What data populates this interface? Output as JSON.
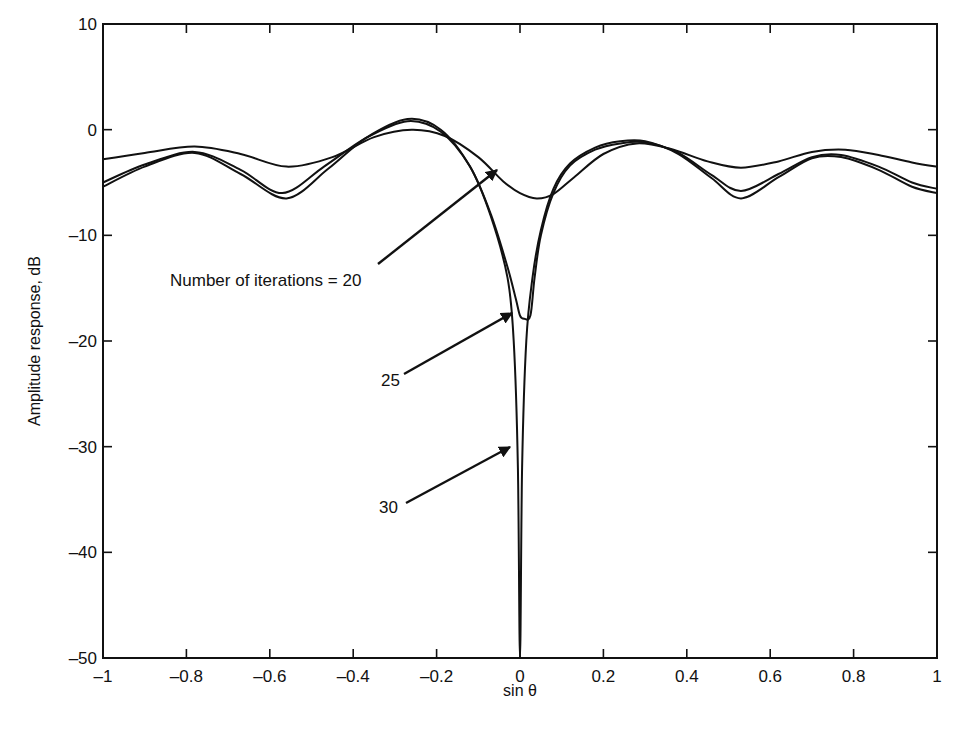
{
  "chart_data": {
    "type": "line",
    "title": "",
    "xlabel": "sin θ",
    "ylabel": "Amplitude response, dB",
    "xlim": [
      -1,
      1
    ],
    "ylim": [
      -50,
      10
    ],
    "grid": false,
    "legend": "none (curves labeled by arrow annotations)",
    "x_ticks": [
      "-1",
      "-0.8",
      "-0.6",
      "-0.4",
      "-0.2",
      "0",
      "0.2",
      "0.4",
      "0.6",
      "0.8",
      "1"
    ],
    "y_ticks": [
      "10",
      "0",
      "-10",
      "-20",
      "-30",
      "-40",
      "-50"
    ],
    "series": [
      {
        "name": "Number of iterations = 20",
        "x": [
          -1.0,
          -0.9,
          -0.78,
          -0.67,
          -0.56,
          -0.45,
          -0.35,
          -0.26,
          -0.18,
          -0.1,
          -0.04,
          0.0,
          0.04,
          0.08,
          0.13,
          0.2,
          0.28,
          0.36,
          0.45,
          0.53,
          0.62,
          0.7,
          0.78,
          0.86,
          0.94,
          1.0
        ],
        "y": [
          -2.8,
          -2.2,
          -1.6,
          -2.3,
          -3.5,
          -2.6,
          -0.7,
          0.0,
          -0.6,
          -2.6,
          -4.9,
          -6.0,
          -6.5,
          -6.1,
          -4.5,
          -2.3,
          -1.3,
          -1.8,
          -3.0,
          -3.6,
          -3.0,
          -2.1,
          -1.9,
          -2.4,
          -3.1,
          -3.5
        ]
      },
      {
        "name": "25",
        "x": [
          -1.0,
          -0.9,
          -0.78,
          -0.67,
          -0.57,
          -0.47,
          -0.37,
          -0.27,
          -0.19,
          -0.12,
          -0.07,
          -0.03,
          -0.01,
          0.0,
          0.01,
          0.025,
          0.035,
          0.05,
          0.08,
          0.12,
          0.18,
          0.24,
          0.3,
          0.38,
          0.46,
          0.53,
          0.62,
          0.7,
          0.77,
          0.86,
          0.94,
          1.0
        ],
        "y": [
          -5.0,
          -3.3,
          -2.1,
          -3.8,
          -6.0,
          -3.5,
          -0.8,
          0.8,
          -0.2,
          -3.5,
          -8.0,
          -13.0,
          -16.0,
          -17.6,
          -17.9,
          -17.6,
          -14.0,
          -10.0,
          -6.0,
          -3.4,
          -1.9,
          -1.3,
          -1.2,
          -2.2,
          -4.3,
          -5.8,
          -4.2,
          -2.6,
          -2.4,
          -3.5,
          -5.0,
          -5.6
        ]
      },
      {
        "name": "30",
        "x": [
          -1.0,
          -0.9,
          -0.78,
          -0.67,
          -0.56,
          -0.46,
          -0.37,
          -0.27,
          -0.19,
          -0.12,
          -0.07,
          -0.03,
          -0.015,
          -0.005,
          0.0,
          0.005,
          0.015,
          0.03,
          0.05,
          0.08,
          0.12,
          0.18,
          0.24,
          0.3,
          0.38,
          0.46,
          0.53,
          0.62,
          0.7,
          0.77,
          0.86,
          0.94,
          1.0
        ],
        "y": [
          -5.4,
          -3.5,
          -2.2,
          -4.2,
          -6.5,
          -3.7,
          -0.8,
          1.0,
          0.0,
          -3.5,
          -8.2,
          -14.0,
          -20.0,
          -32.0,
          -50.0,
          -32.0,
          -20.0,
          -14.0,
          -9.5,
          -5.6,
          -3.2,
          -1.7,
          -1.1,
          -1.1,
          -2.3,
          -4.6,
          -6.5,
          -4.5,
          -2.7,
          -2.6,
          -3.8,
          -5.4,
          -6.0
        ]
      }
    ],
    "annotations": [
      {
        "text": "Number of iterations = 20",
        "points_to": {
          "x": -0.05,
          "y": -3.5
        }
      },
      {
        "text": "25",
        "points_to": {
          "x": -0.01,
          "y": -17
        }
      },
      {
        "text": "30",
        "points_to": {
          "x": -0.005,
          "y": -30
        }
      }
    ]
  },
  "labels": {
    "xlabel": "sin θ",
    "ylabel": "Amplitude response, dB",
    "annot_20": "Number of iterations = 20",
    "annot_25": "25",
    "annot_30": "30"
  }
}
